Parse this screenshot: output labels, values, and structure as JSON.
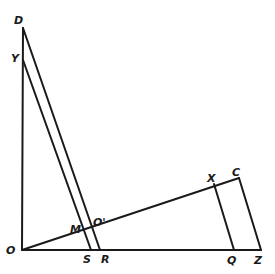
{
  "diagram": {
    "labels": {
      "D": "D",
      "Y": "Y",
      "O": "O",
      "M": "M",
      "O_prime": "O'",
      "S": "S",
      "R": "R",
      "X": "X",
      "C": "C",
      "Q": "Q",
      "Z": "Z"
    },
    "points": {
      "O": [
        22,
        250
      ],
      "D": [
        23,
        28
      ],
      "Y": [
        23,
        60
      ],
      "S": [
        91,
        250
      ],
      "R": [
        100,
        250
      ],
      "M": [
        82,
        230
      ],
      "O_prime": [
        93,
        227
      ],
      "X": [
        214,
        184
      ],
      "C": [
        239,
        178
      ],
      "Q": [
        234,
        250
      ],
      "Z": [
        261,
        250
      ]
    },
    "colors": {
      "ink": "#1a1a1a",
      "background": "#ffffff"
    }
  }
}
